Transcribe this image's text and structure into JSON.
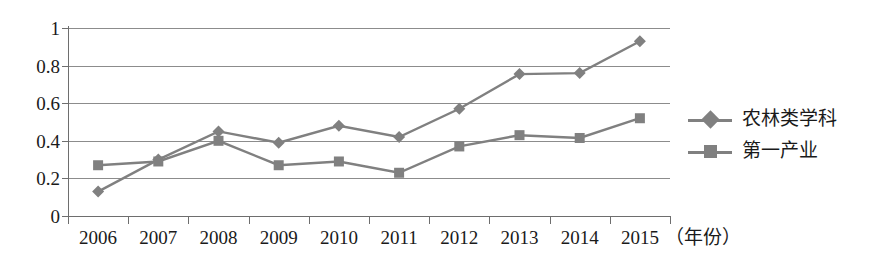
{
  "chart_data": {
    "type": "line",
    "title": "",
    "xlabel": "（年份）",
    "ylabel": "",
    "categories": [
      "2006",
      "2007",
      "2008",
      "2009",
      "2010",
      "2011",
      "2012",
      "2013",
      "2014",
      "2015"
    ],
    "ylim": [
      0,
      1
    ],
    "yticks": [
      "0",
      "0.2",
      "0.4",
      "0.6",
      "0.8",
      "1"
    ],
    "ytick_values": [
      0,
      0.2,
      0.4,
      0.6,
      0.8,
      1
    ],
    "grid": "horizontal",
    "legend_position": "right",
    "series": [
      {
        "name": "农林类学科",
        "marker": "diamond",
        "color": "#808080",
        "values": [
          0.13,
          0.3,
          0.45,
          0.39,
          0.48,
          0.42,
          0.57,
          0.755,
          0.76,
          0.93
        ]
      },
      {
        "name": "第一产业",
        "marker": "square",
        "color": "#808080",
        "values": [
          0.27,
          0.29,
          0.4,
          0.27,
          0.29,
          0.23,
          0.37,
          0.43,
          0.415,
          0.52
        ]
      }
    ]
  },
  "legend": {
    "items": [
      {
        "label": "农林类学科",
        "marker": "diamond"
      },
      {
        "label": "第一产业",
        "marker": "square"
      }
    ]
  },
  "axis": {
    "x_title": "（年份）"
  }
}
